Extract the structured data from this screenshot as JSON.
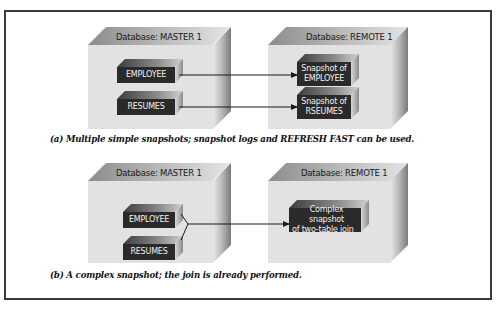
{
  "diagram": {
    "panel_a": {
      "master": {
        "label": "Database: MASTER 1",
        "tables": [
          "EMPLOYEE",
          "RESUMES"
        ]
      },
      "remote": {
        "label": "Database: REMOTE 1",
        "snapshots": [
          {
            "line1": "Snapshot of",
            "line2": "EMPLOYEE"
          },
          {
            "line1": "Snapshot of",
            "line2": "RSEUMES"
          }
        ]
      },
      "caption": "(a) Multiple simple snapshots; snapshot logs and REFRESH FAST can be used."
    },
    "panel_b": {
      "master": {
        "label": "Database: MASTER 1",
        "tables": [
          "EMPLOYEE",
          "RESUMES"
        ]
      },
      "remote": {
        "label": "Database: REMOTE 1",
        "snapshots": [
          {
            "line1": "Complex snapshot",
            "line2": "of two-table join"
          }
        ]
      },
      "caption": "(b) A complex snapshot; the join is already performed."
    },
    "colors": {
      "frame": "#3a3a3a",
      "box_face": "#e2e2e2",
      "table_face": "#2a2a2a",
      "table_text": "#f2f2f2",
      "arrow": "#1a1a1a"
    }
  }
}
